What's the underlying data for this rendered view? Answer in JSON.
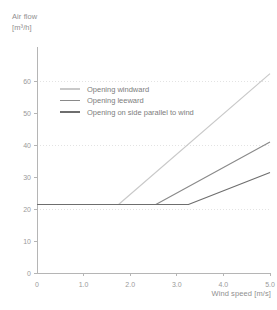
{
  "chart_data": {
    "type": "line",
    "title": "",
    "ylabel": "Air flow",
    "yunit": "[m³/h]",
    "xlabel": "Wind speed [m/s]",
    "xlim": [
      0,
      5
    ],
    "ylim": [
      0,
      65
    ],
    "grid": true,
    "gridlines_y": [
      20,
      40,
      60
    ],
    "xticks": [
      0,
      1,
      2,
      3,
      4,
      5
    ],
    "xtick_labels": [
      "0",
      "1.0",
      "2.0",
      "3.0",
      "4.0",
      "5.0"
    ],
    "yticks": [
      0,
      10,
      20,
      30,
      40,
      50,
      60
    ],
    "ytick_labels": [
      "0",
      "10",
      "20",
      "30",
      "40",
      "50",
      "60"
    ],
    "legend_position": "upper-left-inside",
    "base_value": 21.4,
    "series": [
      {
        "name": "Opening windward",
        "color": "#c9c9c9",
        "breakpoint_x": 1.75,
        "x": [
          0,
          1.75,
          5.0
        ],
        "y": [
          21.4,
          21.4,
          62.3
        ]
      },
      {
        "name": "Opening leeward",
        "color": "#8a8a8a",
        "breakpoint_x": 2.55,
        "x": [
          0,
          2.55,
          5.0
        ],
        "y": [
          21.4,
          21.4,
          40.9
        ]
      },
      {
        "name": "Opening on side parallel to wind",
        "color": "#6e6e6e",
        "breakpoint_x": 3.25,
        "x": [
          0,
          3.25,
          5.0
        ],
        "y": [
          21.4,
          21.4,
          31.4
        ]
      }
    ]
  },
  "axes": {
    "y_title_line1": "Air flow",
    "y_title_line2": "[m³/h]",
    "x_title": "Wind speed [m/s]"
  },
  "ticks": {
    "y": [
      {
        "label": "60",
        "value": 60
      },
      {
        "label": "50",
        "value": 50
      },
      {
        "label": "40",
        "value": 40
      },
      {
        "label": "30",
        "value": 30
      },
      {
        "label": "20",
        "value": 20
      },
      {
        "label": "10",
        "value": 10
      },
      {
        "label": "0",
        "value": 0
      }
    ],
    "x": [
      {
        "label": "0",
        "value": 0
      },
      {
        "label": "1.0",
        "value": 1
      },
      {
        "label": "2.0",
        "value": 2
      },
      {
        "label": "3.0",
        "value": 3
      },
      {
        "label": "4.0",
        "value": 4
      },
      {
        "label": "5.0",
        "value": 5
      }
    ]
  },
  "legend": {
    "items": [
      {
        "label": "Opening windward",
        "color": "#c9c9c9"
      },
      {
        "label": "Opening leeward",
        "color": "#8a8a8a"
      },
      {
        "label": "Opening on side parallel to wind",
        "color": "#6e6e6e"
      }
    ]
  },
  "colors": {
    "axis": "#b5b5b5",
    "grid": "#e3e3e3",
    "text": "#8f8f8f"
  }
}
